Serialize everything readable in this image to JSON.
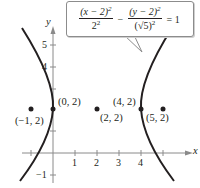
{
  "equation": {
    "num1": "(x − 2)",
    "num1_exp": "2",
    "den1": "2",
    "den1_exp": "2",
    "minus": "−",
    "num2": "(y − 2)",
    "num2_exp": "2",
    "den2": "(√5)",
    "den2_exp": "2",
    "equals": "= 1"
  },
  "axes": {
    "x_label": "x",
    "y_label": "y",
    "x_ticks": [
      "1",
      "2",
      "3",
      "4"
    ],
    "y_ticks": [
      "5",
      "4",
      "−1"
    ]
  },
  "points": [
    {
      "label": "(−1, 2)",
      "x": -1,
      "y": 2
    },
    {
      "label": "(0, 2)",
      "x": 0,
      "y": 2
    },
    {
      "label": "(2, 2)",
      "x": 2,
      "y": 2
    },
    {
      "label": "(4, 2)",
      "x": 4,
      "y": 2
    },
    {
      "label": "(5, 2)",
      "x": 5,
      "y": 2
    }
  ],
  "curve": {
    "type": "hyperbola",
    "center": [
      2,
      2
    ],
    "a": 2,
    "b": 2.236,
    "color": "#231f20"
  }
}
